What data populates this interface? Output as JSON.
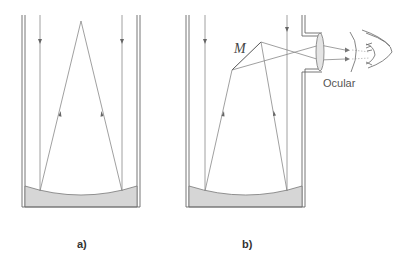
{
  "diagram": {
    "type": "optics-telescope",
    "panels": [
      {
        "id": "a",
        "label": "a)",
        "description": "Concave primary mirror reflecting parallel rays to a focal point"
      },
      {
        "id": "b",
        "label": "b)",
        "description": "Newtonian telescope: flat secondary mirror M redirects rays to side eyepiece",
        "mirror_label": "M",
        "eyepiece_label": "Ocular"
      }
    ],
    "colors": {
      "line": "#555555",
      "ray": "#777777",
      "mirror_fill": "#d4d4d4",
      "background": "#ffffff"
    }
  }
}
